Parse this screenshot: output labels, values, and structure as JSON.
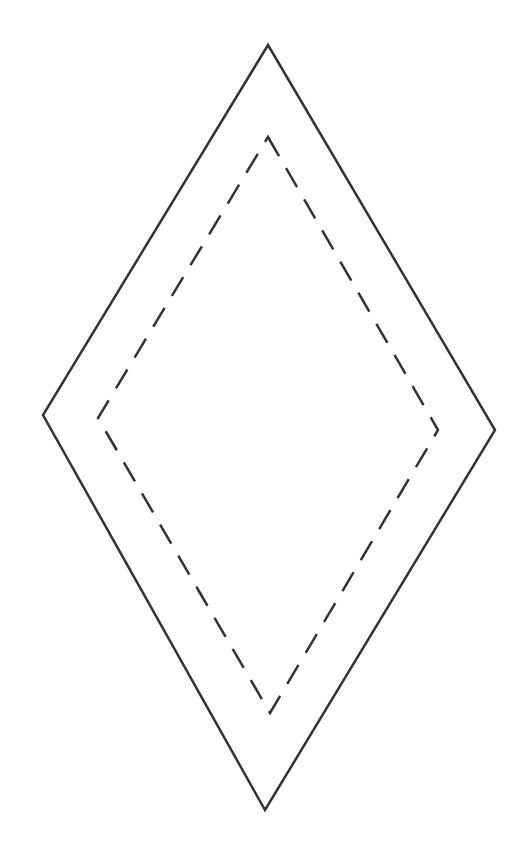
{
  "diagram": {
    "background": "#ffffff",
    "stroke_color": "#333333",
    "outer_diamond": {
      "style": "solid",
      "stroke_width": 2.5,
      "points": [
        [
          268,
          45
        ],
        [
          495,
          430
        ],
        [
          265,
          810
        ],
        [
          43,
          415
        ]
      ]
    },
    "inner_diamond": {
      "style": "dashed",
      "stroke_width": 2.5,
      "dash": "22,14",
      "points": [
        [
          268,
          137
        ],
        [
          438,
          430
        ],
        [
          270,
          713
        ],
        [
          98,
          418
        ]
      ]
    }
  }
}
